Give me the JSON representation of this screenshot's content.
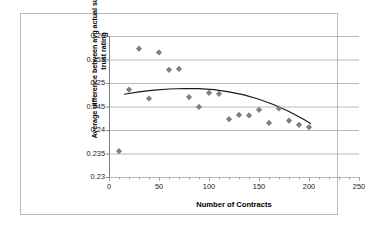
{
  "chart_data": {
    "type": "scatter",
    "title": "",
    "xlabel": "Number of Contracts",
    "ylabel": "Average difference between avg actual success and trust rating",
    "xlim": [
      0,
      250
    ],
    "ylim": [
      0.23,
      0.26
    ],
    "xticks": [
      "0",
      "50",
      "100",
      "150",
      "200",
      "250"
    ],
    "yticks": [
      "0.23",
      "0.235",
      "0.24",
      "0.245",
      "0.25",
      "0.255",
      "0.26"
    ],
    "grid": true,
    "legend": "none",
    "marker": "diamond",
    "marker_color": "#808080",
    "trendline_color": "#1a1a1a",
    "series": [
      {
        "name": "Average difference",
        "points": [
          {
            "x": 10,
            "y": 0.2355
          },
          {
            "x": 20,
            "y": 0.2486
          },
          {
            "x": 30,
            "y": 0.2573
          },
          {
            "x": 40,
            "y": 0.2467
          },
          {
            "x": 50,
            "y": 0.2565
          },
          {
            "x": 60,
            "y": 0.2528
          },
          {
            "x": 70,
            "y": 0.253
          },
          {
            "x": 80,
            "y": 0.247
          },
          {
            "x": 90,
            "y": 0.2449
          },
          {
            "x": 100,
            "y": 0.2479
          },
          {
            "x": 110,
            "y": 0.2477
          },
          {
            "x": 120,
            "y": 0.2423
          },
          {
            "x": 130,
            "y": 0.2432
          },
          {
            "x": 140,
            "y": 0.2431
          },
          {
            "x": 150,
            "y": 0.2443
          },
          {
            "x": 160,
            "y": 0.2415
          },
          {
            "x": 170,
            "y": 0.2446
          },
          {
            "x": 180,
            "y": 0.242
          },
          {
            "x": 190,
            "y": 0.2411
          },
          {
            "x": 200,
            "y": 0.2406
          }
        ]
      }
    ],
    "trendline": {
      "name": "Polynomial trend",
      "points": [
        {
          "x": 15,
          "y": 0.2476
        },
        {
          "x": 30,
          "y": 0.24812
        },
        {
          "x": 45,
          "y": 0.24848
        },
        {
          "x": 60,
          "y": 0.24872
        },
        {
          "x": 75,
          "y": 0.24883
        },
        {
          "x": 90,
          "y": 0.24879
        },
        {
          "x": 105,
          "y": 0.24857
        },
        {
          "x": 120,
          "y": 0.24812
        },
        {
          "x": 135,
          "y": 0.24746
        },
        {
          "x": 150,
          "y": 0.24654
        },
        {
          "x": 165,
          "y": 0.24538
        },
        {
          "x": 180,
          "y": 0.24394
        },
        {
          "x": 195,
          "y": 0.24222
        },
        {
          "x": 202,
          "y": 0.24132
        }
      ]
    }
  }
}
